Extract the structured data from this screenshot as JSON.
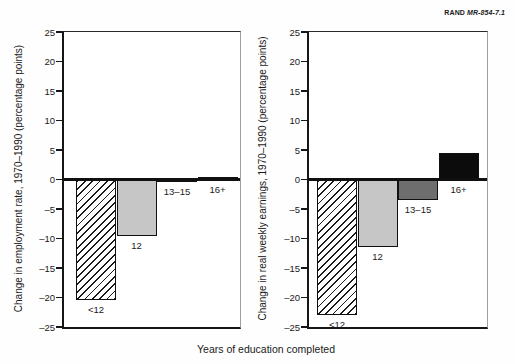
{
  "figure": {
    "credit_brand": "RAND",
    "credit_id": "MR-854-7.1",
    "xlabel": "Years of education completed"
  },
  "chart_data": [
    {
      "type": "bar",
      "title": "Change in employment rate by education",
      "ylabel": "Change in employment rate, 1970–1990 (percentage points)",
      "categories": [
        "<12",
        "12",
        "13–15",
        "16+"
      ],
      "values": [
        -20.5,
        -9.5,
        -0.5,
        0.5
      ],
      "bar_styles": [
        "hatch",
        "lightgray",
        "darkgray",
        "black"
      ],
      "ylim": [
        -25,
        25
      ],
      "ytick_step": 5,
      "yticks": [
        "25",
        "20",
        "15",
        "10",
        "5",
        "0",
        "–5",
        "–10",
        "–15",
        "–20",
        "–25"
      ],
      "grid": false,
      "legend": "none"
    },
    {
      "type": "bar",
      "title": "Change in real weekly earnings by education",
      "ylabel": "Change in real weekly earnings, 1970–1990 (percentage points)",
      "categories": [
        "<12",
        "12",
        "13–15",
        "16+"
      ],
      "values": [
        -23,
        -11.5,
        -3.5,
        4.5
      ],
      "bar_styles": [
        "hatch",
        "lightgray",
        "darkgray",
        "black"
      ],
      "ylim": [
        -25,
        25
      ],
      "ytick_step": 5,
      "yticks": [
        "25",
        "20",
        "15",
        "10",
        "5",
        "0",
        "–5",
        "–10",
        "–15",
        "–20",
        "–25"
      ],
      "grid": false,
      "legend": "none"
    }
  ],
  "colors": {
    "bar_light_gray": "#c6c6c6",
    "bar_dark_gray": "#6e6e6e",
    "bar_black": "#0c0c0c",
    "hatch_foreground": "#1a1a1a",
    "axis": "#161616"
  }
}
